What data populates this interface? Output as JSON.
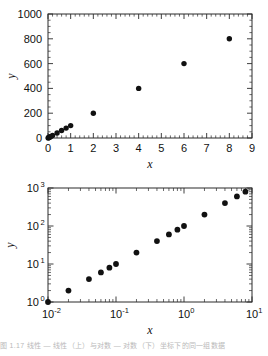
{
  "figure": {
    "caption_fragment": "图 1.17   线性 — 线性（上）与对数 — 对数（下）坐标下的同一组数据"
  },
  "chart_data": [
    {
      "type": "scatter",
      "title": "",
      "xlabel": "x",
      "ylabel": "y",
      "xscale": "linear",
      "yscale": "linear",
      "xlim": [
        0,
        9
      ],
      "ylim": [
        0,
        1000
      ],
      "xticks": [
        0,
        1,
        2,
        3,
        4,
        5,
        6,
        7,
        8,
        9
      ],
      "xticklabels": [
        "0",
        "1",
        "2",
        "3",
        "4",
        "5",
        "6",
        "7",
        "8",
        "9"
      ],
      "yticks": [
        0,
        200,
        400,
        600,
        800,
        1000
      ],
      "yticklabels": [
        "0",
        "200",
        "400",
        "600",
        "800",
        "1000"
      ],
      "minor_ticks": true,
      "grid": false,
      "legend": false,
      "marker": "filled-circle",
      "marker_color": "#111111",
      "x": [
        0.01,
        0.02,
        0.04,
        0.06,
        0.08,
        0.1,
        0.2,
        0.4,
        0.6,
        0.8,
        1.0,
        2.0,
        4.0,
        6.0,
        8.0
      ],
      "y": [
        1,
        2,
        4,
        6,
        8,
        10,
        20,
        40,
        60,
        80,
        100,
        200,
        400,
        600,
        800
      ]
    },
    {
      "type": "scatter",
      "title": "",
      "xlabel": "x",
      "ylabel": "y",
      "xscale": "log",
      "yscale": "log",
      "xlim": [
        0.01,
        10
      ],
      "ylim": [
        1,
        1000
      ],
      "xticklabels": [
        "10-2",
        "10-1",
        "100",
        "101"
      ],
      "xtick_bases": [
        "10",
        "10",
        "10",
        "10"
      ],
      "xtick_exponents": [
        "-2",
        "-1",
        "0",
        "1"
      ],
      "yticklabels": [
        "100",
        "101",
        "102",
        "103"
      ],
      "ytick_bases": [
        "10",
        "10",
        "10",
        "10"
      ],
      "ytick_exponents": [
        "0",
        "1",
        "2",
        "3"
      ],
      "minor_ticks": true,
      "grid": false,
      "legend": false,
      "marker": "filled-circle",
      "marker_color": "#111111",
      "x": [
        0.01,
        0.02,
        0.04,
        0.06,
        0.08,
        0.1,
        0.2,
        0.4,
        0.6,
        0.8,
        1.0,
        2.0,
        4.0,
        6.0,
        8.0
      ],
      "y": [
        1,
        2,
        4,
        6,
        8,
        10,
        20,
        40,
        60,
        80,
        100,
        200,
        400,
        600,
        800
      ]
    }
  ]
}
